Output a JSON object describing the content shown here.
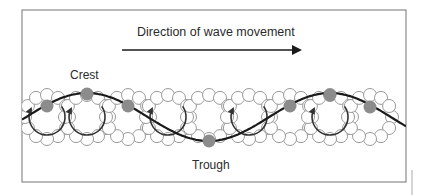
{
  "diagram": {
    "title": "Direction of wave movement",
    "labels": {
      "crest": "Crest",
      "trough": "Trough"
    },
    "colors": {
      "frame": "#8a8a8a",
      "wave": "#1a1a1a",
      "ring": "#9a9a9a",
      "particle": "#8c8c8c",
      "orbit_arrow": "#333333",
      "text": "#2b2b2b"
    },
    "frame": {
      "x": 22,
      "y": 10,
      "width": 384,
      "height": 172
    },
    "direction_arrow": {
      "x1": 122,
      "y1": 50,
      "x2": 300,
      "y2": 50
    },
    "wave": {
      "x_start": 22,
      "x_end": 406,
      "crest_y": 93,
      "trough_y": 141,
      "first_crest_x": 87,
      "wavelength": 243
    },
    "orbit_radius": 22,
    "orbit_centers_x": [
      47,
      87,
      128,
      168,
      209,
      249,
      290,
      330,
      370
    ],
    "particles": [
      {
        "x": 47,
        "y": 106
      },
      {
        "x": 87,
        "y": 94
      },
      {
        "x": 128,
        "y": 106
      },
      {
        "x": 209,
        "y": 141
      },
      {
        "x": 290,
        "y": 106
      },
      {
        "x": 330,
        "y": 95
      },
      {
        "x": 370,
        "y": 107
      }
    ]
  }
}
